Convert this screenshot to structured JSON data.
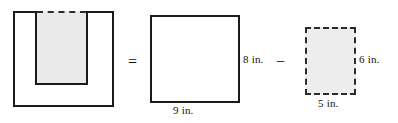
{
  "figure": {
    "operators": {
      "equals": "=",
      "minus": "−"
    },
    "shapes": {
      "composite": {
        "name": "composite-notched-square",
        "outline_style": "solid",
        "notch_top_style": "dashed",
        "notch_fill_color": "#e9e9e9",
        "stroke_color": "#1b1b1b"
      },
      "whole_square": {
        "name": "whole-square",
        "outline_style": "solid",
        "width_label": "9 in.",
        "height_label": "8 in.",
        "stroke_color": "#1b1b1b"
      },
      "removed_rectangle": {
        "name": "removed-rectangle",
        "outline_style": "dashed",
        "width_label": "5 in.",
        "height_label": "6 in.",
        "fill_color": "#ededed",
        "stroke_color": "#2a2a2a"
      }
    }
  },
  "chart_data": {
    "type": "diagram",
    "units": "in.",
    "expression": "9 in. × 8 in. − 5 in. × 6 in.",
    "terms": [
      {
        "role": "result",
        "shape": "notched-square",
        "style": "solid outline with dashed top on notch, shaded notch"
      },
      {
        "role": "minuend",
        "shape": "square",
        "width": 9,
        "height": 8,
        "width_label": "9 in.",
        "height_label": "8 in.",
        "style": "solid"
      },
      {
        "role": "subtrahend",
        "shape": "rectangle",
        "width": 5,
        "height": 6,
        "width_label": "5 in.",
        "height_label": "6 in.",
        "style": "dashed, shaded"
      }
    ]
  }
}
